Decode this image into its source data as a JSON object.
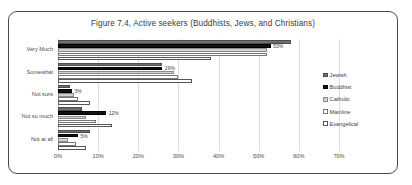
{
  "chart_data": {
    "type": "bar",
    "orientation": "horizontal",
    "title": "Figure 7.4, Active seekers (Buddhists, Jews, and Christians)",
    "xlabel": "",
    "ylabel": "",
    "categories": [
      "Very Much",
      "Somewhat",
      "Not sure",
      "Not so much",
      "Not at all"
    ],
    "series": [
      {
        "name": "Jewish",
        "color": "#6e6e6e",
        "values": [
          58,
          26,
          3,
          6,
          8
        ]
      },
      {
        "name": "Buddhist",
        "color": "#111111",
        "values": [
          53,
          26,
          3.5,
          12,
          5
        ]
      },
      {
        "name": "Catholic",
        "color": "#d2d2d2",
        "values": [
          52,
          29,
          4,
          7,
          2.5
        ]
      },
      {
        "name": "Mainline",
        "color": "#ffffff",
        "values": [
          52,
          30,
          5,
          9.5,
          4.5
        ]
      },
      {
        "name": "Evangelical",
        "color": "#ffffff",
        "values": [
          38,
          33.5,
          8,
          13.5,
          7
        ]
      }
    ],
    "xlim": [
      0,
      70
    ],
    "xticks": [
      "0%",
      "10%",
      "20%",
      "30%",
      "40%",
      "50%",
      "60%",
      "70%"
    ],
    "xtick_values": [
      0,
      10,
      20,
      30,
      40,
      50,
      60,
      70
    ],
    "grid": true,
    "legend_position": "right",
    "data_labels": [
      {
        "category": "Very Much",
        "series": "Buddhist",
        "text": "53%"
      },
      {
        "category": "Somewhat",
        "series": "Buddhist",
        "text": "26%"
      },
      {
        "category": "Not sure",
        "series": "Buddhist",
        "text": "3%"
      },
      {
        "category": "Not so much",
        "series": "Buddhist",
        "text": "12%"
      },
      {
        "category": "Not at all",
        "series": "Buddhist",
        "text": "5%"
      }
    ]
  }
}
